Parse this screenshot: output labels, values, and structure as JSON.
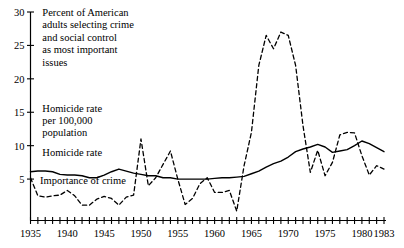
{
  "chart_data": {
    "type": "line",
    "title": "",
    "xlabel": "",
    "ylabel": "",
    "xlim": [
      1935,
      1983
    ],
    "ylim": [
      0,
      30
    ],
    "yticks": [
      5,
      10,
      15,
      20,
      25,
      30
    ],
    "xticks_labeled": [
      1935,
      1940,
      1945,
      1950,
      1955,
      1960,
      1965,
      1970,
      1975,
      1980,
      1983
    ],
    "xtick_step": 1,
    "grid": false,
    "legend": "inline-annotations",
    "annotations": [
      {
        "name": "y-axis-note",
        "text": "Percent of American\nadults selecting crime\nand social control\nas most important\nissues",
        "x": 1936.6,
        "y": 29.4
      },
      {
        "name": "series-unit-note",
        "text": "Homicide rate\nper 100,000\npopulation",
        "x": 1936.6,
        "y": 15.1
      },
      {
        "name": "homicide-label",
        "text": "Homicide rate",
        "x": 1936.6,
        "y": 8.4
      },
      {
        "name": "importance-label",
        "text": "Importance of crime",
        "x": 1936.3,
        "y": 4.3
      }
    ],
    "series": [
      {
        "name": "Homicide rate",
        "style": "solid",
        "color": "#000000",
        "x": [
          1935,
          1936,
          1937,
          1938,
          1939,
          1940,
          1941,
          1942,
          1943,
          1944,
          1945,
          1946,
          1947,
          1948,
          1949,
          1950,
          1951,
          1952,
          1953,
          1954,
          1955,
          1956,
          1957,
          1958,
          1959,
          1960,
          1961,
          1962,
          1963,
          1964,
          1965,
          1966,
          1967,
          1968,
          1969,
          1970,
          1971,
          1972,
          1973,
          1974,
          1975,
          1976,
          1977,
          1978,
          1979,
          1980,
          1981,
          1982,
          1983
        ],
        "values": [
          6.1,
          6.2,
          6.2,
          6.1,
          5.7,
          5.6,
          5.6,
          5.5,
          5.2,
          5.2,
          5.6,
          6.1,
          6.5,
          6.2,
          5.9,
          5.7,
          5.5,
          5.5,
          5.2,
          5.2,
          5.0,
          5.0,
          5.0,
          5.0,
          5.0,
          5.1,
          5.2,
          5.2,
          5.3,
          5.4,
          5.8,
          6.2,
          6.8,
          7.3,
          7.7,
          8.3,
          9.1,
          9.5,
          9.8,
          10.2,
          9.8,
          9.0,
          9.2,
          9.4,
          10.0,
          10.7,
          10.3,
          9.7,
          9.1
        ]
      },
      {
        "name": "Importance of crime",
        "style": "dashed",
        "color": "#000000",
        "x": [
          1935,
          1936,
          1937,
          1938,
          1939,
          1940,
          1941,
          1942,
          1943,
          1944,
          1945,
          1946,
          1947,
          1948,
          1949,
          1950,
          1951,
          1952,
          1953,
          1954,
          1955,
          1956,
          1957,
          1958,
          1959,
          1960,
          1961,
          1962,
          1963,
          1964,
          1965,
          1966,
          1967,
          1968,
          1969,
          1970,
          1971,
          1972,
          1973,
          1974,
          1975,
          1976,
          1977,
          1978,
          1979,
          1980,
          1981,
          1982,
          1983
        ],
        "values": [
          5.2,
          2.5,
          2.3,
          2.5,
          2.6,
          3.3,
          2.5,
          1.1,
          1.1,
          2.0,
          2.4,
          2.1,
          1.1,
          2.3,
          2.6,
          11.0,
          4.0,
          5.2,
          7.2,
          9.2,
          5.0,
          1.2,
          2.1,
          4.3,
          5.2,
          3.0,
          3.0,
          3.3,
          0.2,
          7.0,
          12.0,
          22.0,
          26.5,
          24.5,
          27.0,
          26.5,
          22.0,
          13.0,
          6.0,
          9.3,
          5.5,
          7.5,
          11.6,
          12.0,
          11.9,
          8.5,
          5.6,
          7.0,
          6.5
        ]
      }
    ]
  },
  "axis": {
    "y_tick_labels": [
      "30",
      "25",
      "20",
      "15",
      "10",
      "5"
    ],
    "x_tick_labels": [
      "1935",
      "1940",
      "1945",
      "1950",
      "1955",
      "1960",
      "1965",
      "1970",
      "1975",
      "1980",
      "1983"
    ]
  },
  "text_blocks": {
    "note_main_lines": [
      "Percent of American",
      "adults selecting crime",
      "and social control",
      "as most important",
      "issues"
    ],
    "note_unit_lines": [
      "Homicide rate",
      "per 100,000",
      "population"
    ],
    "label_homicide": "Homicide rate",
    "label_importance": "Importance of crime"
  }
}
